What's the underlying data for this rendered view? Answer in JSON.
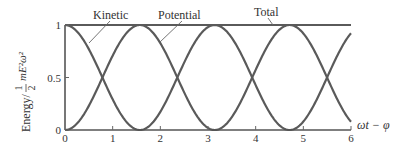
{
  "chart_data": {
    "type": "line",
    "title": "",
    "xlabel": "ωt − φ",
    "ylabel": "Energy / ½ m E² ω²",
    "ylabel_parts": {
      "prefix": "Energy/",
      "num": "1",
      "den": "2",
      "suffix": "mE²ω²"
    },
    "xlim": [
      0,
      6
    ],
    "ylim": [
      0,
      1
    ],
    "x_ticks": [
      0,
      1,
      2,
      3,
      4,
      5,
      6
    ],
    "x_tick_labels": [
      "0",
      "1",
      "2",
      "3",
      "4",
      "5",
      "6"
    ],
    "y_ticks": [
      0,
      0.5,
      1
    ],
    "y_tick_labels": [
      "0",
      "0.5",
      "1"
    ],
    "grid": false,
    "legend_position": "inline-annotations",
    "series": [
      {
        "name": "Kinetic",
        "formula": "cos^2(x)",
        "x": [
          0,
          0.785,
          1.571,
          2.356,
          3.142,
          3.927,
          4.712,
          5.498,
          6.0
        ],
        "values": [
          1,
          0.5,
          0,
          0.5,
          1,
          0.5,
          0,
          0.5,
          0.921
        ]
      },
      {
        "name": "Potential",
        "formula": "sin^2(x)",
        "x": [
          0,
          0.785,
          1.571,
          2.356,
          3.142,
          3.927,
          4.712,
          5.498,
          6.0
        ],
        "values": [
          0,
          0.5,
          1,
          0.5,
          0,
          0.5,
          1,
          0.5,
          0.079
        ]
      },
      {
        "name": "Total",
        "formula": "1",
        "x": [
          0,
          6
        ],
        "values": [
          1,
          1
        ]
      }
    ],
    "annotations": [
      {
        "text": "Kinetic",
        "points_to": "Kinetic curve near x≈0.5"
      },
      {
        "text": "Potential",
        "points_to": "Potential curve near x≈2.0"
      },
      {
        "text": "Total",
        "points_to": "Total line near x≈4.3"
      }
    ]
  }
}
